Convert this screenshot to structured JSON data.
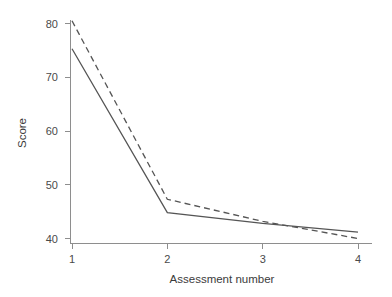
{
  "chart_data": {
    "type": "line",
    "title": "",
    "xlabel": "Assessment number",
    "ylabel": "Score",
    "x": [
      1,
      2,
      3,
      4
    ],
    "xticklabels": [
      "1",
      "2",
      "3",
      "4"
    ],
    "yticks": [
      40,
      50,
      60,
      70,
      80
    ],
    "yticklabels": [
      "40",
      "50",
      "60",
      "70",
      "80"
    ],
    "xlim": [
      0.85,
      4.15
    ],
    "ylim": [
      38.8,
      81.5
    ],
    "grid": false,
    "legend": "none",
    "series": [
      {
        "name": "solid-line",
        "style": "solid",
        "color": "#555555",
        "values": [
          75.3,
          44.8,
          42.8,
          41.2
        ]
      },
      {
        "name": "dashed-line",
        "style": "dashed",
        "color": "#555555",
        "values": [
          80.5,
          47.3,
          43.2,
          40.0
        ]
      }
    ],
    "annotations": []
  },
  "axes": {
    "x_axis_title": "Assessment number",
    "y_axis_title": "Score"
  }
}
